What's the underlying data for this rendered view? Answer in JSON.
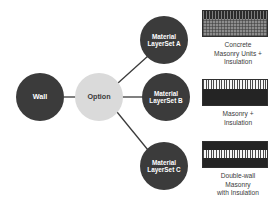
{
  "diagram": {
    "colors": {
      "node_dark": "#3b3b3b",
      "node_light": "#dadada",
      "node_dark_text": "#ffffff",
      "node_light_text": "#3b3b3b",
      "edge": "#3b3b3b",
      "background": "#ffffff",
      "swatch_border": "#2f2f2f"
    },
    "nodes": [
      {
        "id": "wall",
        "label": "Wall",
        "label_lines": [
          "Wall"
        ],
        "style": "dark",
        "cx": 40,
        "cy": 97,
        "r": 24
      },
      {
        "id": "option",
        "label": "Option",
        "label_lines": [
          "Option"
        ],
        "style": "light",
        "cx": 99,
        "cy": 97,
        "r": 24
      },
      {
        "id": "mls-a",
        "label": "Material LayerSet A",
        "label_lines": [
          "Material",
          "LayerSet A"
        ],
        "style": "dark",
        "cx": 164,
        "cy": 40,
        "r": 24
      },
      {
        "id": "mls-b",
        "label": "Material LayerSet B",
        "label_lines": [
          "Material",
          "LayerSet B"
        ],
        "style": "dark",
        "cx": 166,
        "cy": 97,
        "r": 24
      },
      {
        "id": "mls-c",
        "label": "Material LayerSet C",
        "label_lines": [
          "Material",
          "LayerSet C"
        ],
        "style": "dark",
        "cx": 164,
        "cy": 166,
        "r": 24
      }
    ],
    "edges": [
      {
        "from": "wall",
        "to": "option",
        "x1": 64,
        "y1": 97,
        "x2": 75,
        "y2": 97
      },
      {
        "from": "option",
        "to": "mls-a",
        "x1": 118,
        "y1": 82,
        "x2": 147,
        "y2": 55
      },
      {
        "from": "option",
        "to": "mls-b",
        "x1": 123,
        "y1": 97,
        "x2": 142,
        "y2": 97
      },
      {
        "from": "option",
        "to": "mls-c",
        "x1": 117,
        "y1": 112,
        "x2": 147,
        "y2": 150
      }
    ]
  },
  "legend": {
    "items": [
      {
        "id": "concrete-masonry-units-insulation",
        "caption_lines": [
          "Concrete",
          "Masonry Units +",
          "Insulation"
        ],
        "caption": "Concrete Masonry Units + Insulation",
        "bands": [
          {
            "fill": "hatch-dark-vert",
            "height_pct": 33
          },
          {
            "fill": "stipple",
            "height_pct": 67
          }
        ]
      },
      {
        "id": "masonry-insulation",
        "caption_lines": [
          "Masonry +",
          "Insulation"
        ],
        "caption": "Masonry + Insulation",
        "bands": [
          {
            "fill": "hatch-light-vert",
            "height_pct": 37
          },
          {
            "fill": "solid-dark",
            "height_pct": 63
          }
        ]
      },
      {
        "id": "double-wall-masonry-with-insulation",
        "caption_lines": [
          "Double-wall",
          "Masonry",
          "with Insulation"
        ],
        "caption": "Double-wall Masonry with Insulation",
        "bands": [
          {
            "fill": "solid-dark",
            "height_pct": 31
          },
          {
            "fill": "hatch-light-vert",
            "height_pct": 34
          },
          {
            "fill": "solid-dark",
            "height_pct": 35
          }
        ]
      }
    ]
  }
}
